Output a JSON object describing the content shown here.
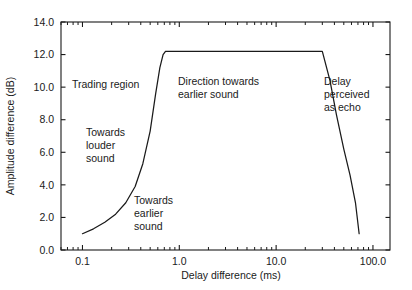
{
  "chart_data": {
    "type": "line",
    "title": "",
    "xlabel": "Delay difference (ms)",
    "ylabel": "Amplitude difference (dB)",
    "xscale": "log",
    "yscale": "linear",
    "xlim": [
      0.06,
      150.0
    ],
    "ylim": [
      0.0,
      14.0
    ],
    "grid": false,
    "legend": null,
    "xticks_major": [
      "0.1",
      "1.0",
      "10.0",
      "100.0"
    ],
    "xticks_major_values": [
      0.1,
      1.0,
      10.0,
      100.0
    ],
    "yticks": [
      "0.0",
      "2.0",
      "4.0",
      "6.0",
      "8.0",
      "10.0",
      "12.0",
      "14.0"
    ],
    "yticks_values": [
      0.0,
      2.0,
      4.0,
      6.0,
      8.0,
      10.0,
      12.0,
      14.0
    ],
    "series": [
      {
        "name": "Summing localization boundary",
        "color": "#1a1a1a",
        "x": [
          0.1,
          0.13,
          0.17,
          0.22,
          0.28,
          0.35,
          0.42,
          0.5,
          0.57,
          0.63,
          0.68,
          0.72,
          0.78,
          1.0,
          2.0,
          5.0,
          10.0,
          20.0,
          30.0,
          36.0,
          42.0,
          50.0,
          58.0,
          66.0,
          72.0
        ],
        "y": [
          1.0,
          1.3,
          1.7,
          2.2,
          2.9,
          3.9,
          5.3,
          7.3,
          9.6,
          11.2,
          12.0,
          12.2,
          12.2,
          12.2,
          12.2,
          12.2,
          12.2,
          12.2,
          12.2,
          10.4,
          8.3,
          6.2,
          4.6,
          2.9,
          1.0
        ]
      }
    ],
    "annotations": [
      {
        "id": "trading-region",
        "text": [
          "Trading region"
        ],
        "x_px": 72,
        "y_px": 88
      },
      {
        "id": "towards-louder-sound",
        "text": [
          "Towards",
          "louder",
          "sound"
        ],
        "x_px": 86,
        "y_px": 136
      },
      {
        "id": "towards-earlier-sound",
        "text": [
          "Towards",
          "earlier",
          "sound"
        ],
        "x_px": 134,
        "y_px": 204
      },
      {
        "id": "direction-towards-earlier-sound",
        "text": [
          "Direction towards",
          "earlier sound"
        ],
        "x_px": 178,
        "y_px": 85
      },
      {
        "id": "delay-perceived-as-echo",
        "text": [
          "Delay",
          "perceived",
          "as echo"
        ],
        "x_px": 324,
        "y_px": 85
      }
    ]
  },
  "axes": {
    "x_title": "Delay difference (ms)",
    "y_title": "Amplitude difference (dB)"
  }
}
